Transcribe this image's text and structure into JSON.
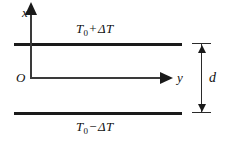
{
  "figure": {
    "type": "physics-diagram",
    "background_color": "#ffffff",
    "line_color": "#1a1a1a"
  },
  "axes": {
    "x_label": "x",
    "y_label": "y",
    "origin_label": "O",
    "x_direction": "up",
    "y_direction": "right"
  },
  "plates": {
    "top": {
      "temperature_label": {
        "symbol": "T",
        "subscript": "0",
        "operator": "+",
        "delta": "ΔT",
        "full": "T₀ + ΔT"
      }
    },
    "bottom": {
      "temperature_label": {
        "symbol": "T",
        "subscript": "0",
        "operator": "−",
        "delta": "ΔT",
        "full": "T₀ − ΔT"
      }
    }
  },
  "dimension": {
    "label": "d",
    "meaning": "separation between the two plates"
  }
}
